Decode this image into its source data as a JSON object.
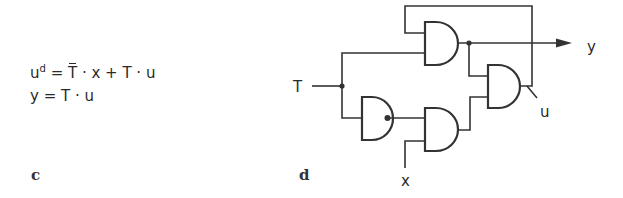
{
  "equations": {
    "eq1": {
      "lhs_base": "u",
      "lhs_sup": "d",
      "equals": " = ",
      "term1_var": "T",
      "term1_rest": " · x + T · u"
    },
    "eq2": {
      "text": "y = T · u"
    }
  },
  "panels": {
    "c": "c",
    "d": "d"
  },
  "circuit": {
    "labels": {
      "input_T": "T",
      "input_x": "x",
      "output_y": "y",
      "state_u": "u"
    },
    "gates": [
      {
        "id": "and-top",
        "type": "AND",
        "inputs": [
          "u (feedback)",
          "T"
        ],
        "output": "y"
      },
      {
        "id": "nand-T",
        "type": "NOT (inverter as NAND)",
        "inputs": [
          "T"
        ],
        "output": "T̄"
      },
      {
        "id": "and-mid",
        "type": "AND",
        "inputs": [
          "T̄",
          "x"
        ],
        "output": "T̄·x"
      },
      {
        "id": "or-right",
        "type": "OR",
        "inputs": [
          "y",
          "T̄·x"
        ],
        "output": "u"
      }
    ],
    "colors": {
      "stroke": "#333333",
      "background": "#ffffff"
    }
  }
}
